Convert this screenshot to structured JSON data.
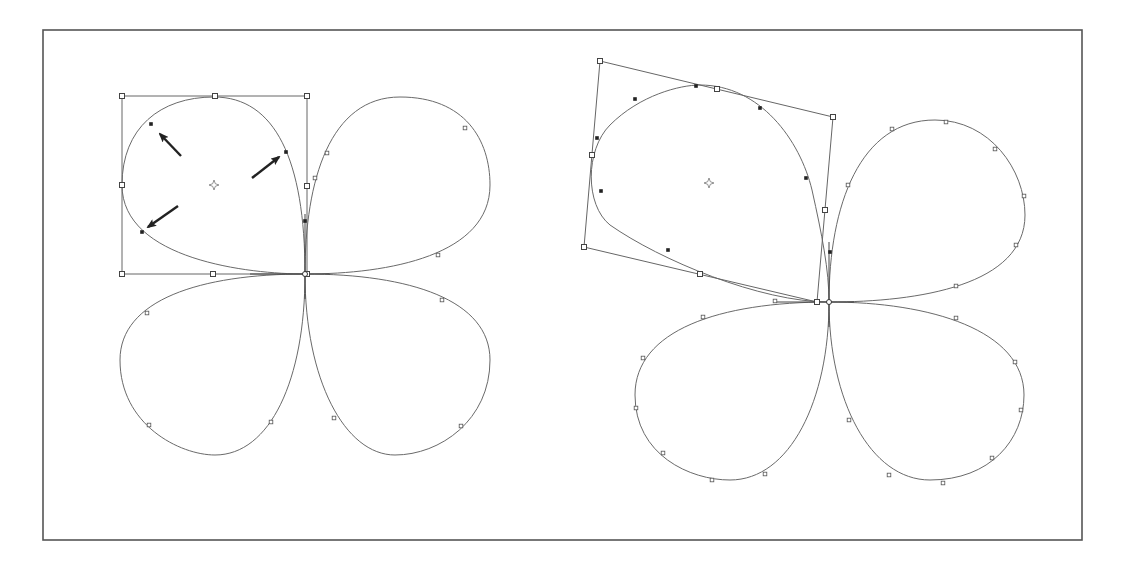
{
  "figure": {
    "colors": {
      "frame": "#555555",
      "path": "#6a6a6a",
      "box": "#666666",
      "arrow": "#222222",
      "anchor_fill": "#ffffff",
      "selected_anchor": "#222222"
    },
    "frame": {
      "x": 43,
      "y": 30,
      "w": 1039,
      "h": 510
    }
  },
  "left_clover": {
    "center": [
      305,
      274
    ],
    "petals": [
      {
        "name": "top-left-selected",
        "d": "M305,274 C250,274 122,260 122,185 C122,128 160,97 214,97 C275,97 305,160 305,274 Z"
      },
      {
        "name": "top-right",
        "d": "M305,274 C305,180 330,97 400,97 C465,97 490,140 490,185 C490,255 390,274 305,274 Z"
      },
      {
        "name": "bottom-left",
        "d": "M305,274 C200,274 120,300 120,360 C120,425 180,455 215,455 C270,455 305,380 305,274 Z"
      },
      {
        "name": "bottom-right",
        "d": "M305,274 C305,380 345,455 395,455 C440,455 490,420 490,360 C490,300 410,274 305,274 Z"
      }
    ],
    "anchors": [
      [
        327,
        153
      ],
      [
        315,
        178
      ],
      [
        465,
        128
      ],
      [
        438,
        255
      ],
      [
        147,
        313
      ],
      [
        149,
        425
      ],
      [
        271,
        422
      ],
      [
        442,
        300
      ],
      [
        334,
        418
      ],
      [
        461,
        426
      ]
    ],
    "selected_anchors": [
      [
        151,
        124
      ],
      [
        286,
        152
      ],
      [
        142,
        232
      ],
      [
        305,
        221
      ]
    ],
    "bbox": {
      "points": [
        [
          122,
          96
        ],
        [
          307,
          96
        ],
        [
          307,
          274
        ],
        [
          122,
          274
        ]
      ],
      "handles": [
        [
          122,
          96
        ],
        [
          215,
          96
        ],
        [
          307,
          96
        ],
        [
          307,
          186
        ],
        [
          307,
          274
        ],
        [
          213,
          274
        ],
        [
          122,
          274
        ],
        [
          122,
          185
        ]
      ]
    },
    "center_mark": [
      214,
      185
    ],
    "arrows": [
      {
        "from": [
          181,
          156
        ],
        "to": [
          160,
          134
        ],
        "name": "arrow-up-left"
      },
      {
        "from": [
          252,
          178
        ],
        "to": [
          279,
          157
        ],
        "name": "arrow-up-right"
      },
      {
        "from": [
          178,
          206
        ],
        "to": [
          148,
          227
        ],
        "name": "arrow-down-left"
      }
    ]
  },
  "right_clover": {
    "center": [
      829,
      302
    ],
    "petals": [
      {
        "name": "top-left-rotated",
        "d": "M829,302 C760,302 660,260 610,225 C585,205 585,150 610,125 C640,95 680,85 700,85 C760,85 800,140 812,190 C822,235 829,270 829,302 Z"
      },
      {
        "name": "top-right",
        "d": "M829,302 C829,205 860,120 935,120 C990,120 1025,170 1025,215 C1025,285 920,302 829,302 Z"
      },
      {
        "name": "bottom-left",
        "d": "M829,302 C720,302 635,330 635,395 C635,455 690,480 730,480 C790,480 829,400 829,302 Z"
      },
      {
        "name": "bottom-right",
        "d": "M829,302 C829,400 870,480 930,480 C990,480 1024,440 1024,395 C1024,330 930,302 829,302 Z"
      }
    ],
    "anchors": [
      [
        848,
        185
      ],
      [
        892,
        129
      ],
      [
        946,
        122
      ],
      [
        995,
        149
      ],
      [
        1024,
        196
      ],
      [
        1016,
        245
      ],
      [
        956,
        286
      ],
      [
        703,
        317
      ],
      [
        643,
        358
      ],
      [
        636,
        408
      ],
      [
        663,
        453
      ],
      [
        712,
        480
      ],
      [
        765,
        474
      ],
      [
        849,
        420
      ],
      [
        889,
        475
      ],
      [
        943,
        483
      ],
      [
        992,
        458
      ],
      [
        1021,
        410
      ],
      [
        1015,
        362
      ],
      [
        956,
        318
      ],
      [
        775,
        301
      ]
    ],
    "selected_anchors": [
      [
        696,
        86
      ],
      [
        635,
        99
      ],
      [
        760,
        108
      ],
      [
        597,
        138
      ],
      [
        601,
        191
      ],
      [
        806,
        178
      ],
      [
        668,
        250
      ],
      [
        830,
        252
      ]
    ],
    "bbox": {
      "points": [
        [
          600,
          61
        ],
        [
          833,
          117
        ],
        [
          817,
          302
        ],
        [
          584,
          247
        ]
      ],
      "handles": [
        [
          600,
          61
        ],
        [
          717,
          89
        ],
        [
          833,
          117
        ],
        [
          825,
          210
        ],
        [
          817,
          302
        ],
        [
          700,
          274
        ],
        [
          584,
          247
        ],
        [
          592,
          155
        ]
      ]
    },
    "center_mark": [
      709,
      183
    ]
  }
}
